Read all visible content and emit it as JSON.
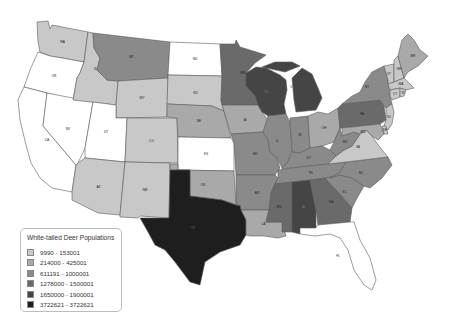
{
  "title": "White-tailed Deer Populations",
  "legend": {
    "title": "White-tailed Deer Populations",
    "classes": [
      {
        "label": "9990 - 153001",
        "color": "#c8c8c8"
      },
      {
        "label": "214000 - 425001",
        "color": "#a9a9a9"
      },
      {
        "label": "611191 - 1000001",
        "color": "#8a8a8a"
      },
      {
        "label": "1278000 - 1500001",
        "color": "#6a6a6a"
      },
      {
        "label": "1650000 - 1900001",
        "color": "#454545"
      },
      {
        "label": "3722621 - 3722621",
        "color": "#1e1e1e"
      }
    ],
    "no_data_color": "#ffffff"
  },
  "states": [
    {
      "abbr": "WA",
      "class": 0
    },
    {
      "abbr": "OR",
      "class": null
    },
    {
      "abbr": "CA",
      "class": null
    },
    {
      "abbr": "NV",
      "class": null
    },
    {
      "abbr": "ID",
      "class": 0
    },
    {
      "abbr": "MT",
      "class": 2
    },
    {
      "abbr": "WY",
      "class": 0
    },
    {
      "abbr": "UT",
      "class": null
    },
    {
      "abbr": "AZ",
      "class": 0
    },
    {
      "abbr": "CO",
      "class": 0
    },
    {
      "abbr": "NM",
      "class": 0
    },
    {
      "abbr": "ND",
      "class": null
    },
    {
      "abbr": "SD",
      "class": 0
    },
    {
      "abbr": "NE",
      "class": 1
    },
    {
      "abbr": "KS",
      "class": null
    },
    {
      "abbr": "OK",
      "class": 1
    },
    {
      "abbr": "TX",
      "class": 5
    },
    {
      "abbr": "MN",
      "class": 3
    },
    {
      "abbr": "IA",
      "class": 1
    },
    {
      "abbr": "MO",
      "class": 2
    },
    {
      "abbr": "AR",
      "class": 2
    },
    {
      "abbr": "LA",
      "class": 1
    },
    {
      "abbr": "WI",
      "class": 4
    },
    {
      "abbr": "IL",
      "class": 2
    },
    {
      "abbr": "MI",
      "class": 4
    },
    {
      "abbr": "IN",
      "class": 2
    },
    {
      "abbr": "OH",
      "class": 1
    },
    {
      "abbr": "KY",
      "class": 2
    },
    {
      "abbr": "TN",
      "class": 2
    },
    {
      "abbr": "MS",
      "class": 3
    },
    {
      "abbr": "AL",
      "class": 4
    },
    {
      "abbr": "GA",
      "class": 3
    },
    {
      "abbr": "FL",
      "class": null
    },
    {
      "abbr": "SC",
      "class": 2
    },
    {
      "abbr": "NC",
      "class": 2
    },
    {
      "abbr": "VA",
      "class": 0
    },
    {
      "abbr": "WV",
      "class": 2
    },
    {
      "abbr": "PA",
      "class": 3
    },
    {
      "abbr": "NY",
      "class": 2
    },
    {
      "abbr": "VT",
      "class": 0
    },
    {
      "abbr": "NH",
      "class": 0
    },
    {
      "abbr": "ME",
      "class": 1
    },
    {
      "abbr": "MA",
      "class": 0
    },
    {
      "abbr": "CT",
      "class": 0
    },
    {
      "abbr": "RI",
      "class": 0
    },
    {
      "abbr": "NJ",
      "class": 0
    },
    {
      "abbr": "DE",
      "class": 0
    },
    {
      "abbr": "MD",
      "class": 1
    }
  ]
}
